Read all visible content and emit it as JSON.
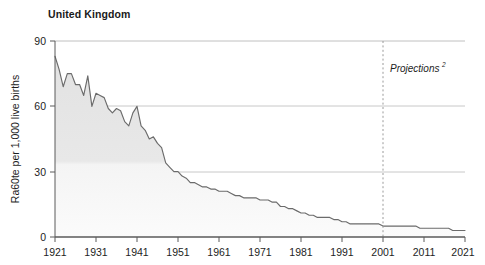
{
  "chart_data": {
    "type": "area",
    "title": "United Kingdom",
    "xlabel": "",
    "ylabel": "Ra60te per 1,000 live births",
    "xlim": [
      1921,
      2021
    ],
    "ylim": [
      0,
      90
    ],
    "yticks": [
      0,
      30,
      60,
      90
    ],
    "ytick_labels": [
      "0",
      "30",
      "60",
      "90"
    ],
    "xticks": [
      1921,
      1931,
      1941,
      1951,
      1961,
      1971,
      1981,
      1991,
      2001,
      2011,
      2021
    ],
    "xtick_labels": [
      "1921",
      "1931",
      "1941",
      "1951",
      "1961",
      "1971",
      "1981",
      "1991",
      "2001",
      "2011",
      "2021"
    ],
    "grid": "horizontal",
    "legend": "none",
    "line_color": "#6b6b6b",
    "fill_color": "#e4e4e4",
    "annotations": [
      {
        "name": "projections-label",
        "text": "Projections",
        "superscript": "2",
        "x": 2004,
        "y": 73,
        "style": "italic"
      },
      {
        "name": "projections-divider",
        "type": "vertical-dashed-line",
        "x": 2001,
        "color": "#9a9a9a"
      }
    ],
    "x": [
      1921,
      1922,
      1923,
      1924,
      1925,
      1926,
      1927,
      1928,
      1929,
      1930,
      1931,
      1932,
      1933,
      1934,
      1935,
      1936,
      1937,
      1938,
      1939,
      1940,
      1941,
      1942,
      1943,
      1944,
      1945,
      1946,
      1947,
      1948,
      1949,
      1950,
      1951,
      1952,
      1953,
      1954,
      1955,
      1956,
      1957,
      1958,
      1959,
      1960,
      1961,
      1962,
      1963,
      1964,
      1965,
      1966,
      1967,
      1968,
      1969,
      1970,
      1971,
      1972,
      1973,
      1974,
      1975,
      1976,
      1977,
      1978,
      1979,
      1980,
      1981,
      1982,
      1983,
      1984,
      1985,
      1986,
      1987,
      1988,
      1989,
      1990,
      1991,
      1992,
      1993,
      1994,
      1995,
      1996,
      1997,
      1998,
      1999,
      2000,
      2001,
      2002,
      2003,
      2004,
      2005,
      2006,
      2007,
      2008,
      2009,
      2010,
      2011,
      2012,
      2013,
      2014,
      2015,
      2016,
      2017,
      2018,
      2019,
      2020,
      2021
    ],
    "values": [
      83,
      77,
      69,
      75,
      75,
      70,
      70,
      65,
      74,
      60,
      66,
      65,
      64,
      59,
      57,
      59,
      58,
      53,
      51,
      57,
      60,
      51,
      49,
      45,
      46,
      43,
      41,
      34,
      32,
      30,
      30,
      28,
      27,
      25,
      25,
      24,
      23,
      23,
      22,
      22,
      21,
      21,
      21,
      20,
      19,
      19,
      18,
      18,
      18,
      18,
      17,
      17,
      17,
      16,
      16,
      14,
      14,
      13,
      13,
      12,
      11,
      11,
      10,
      10,
      9,
      9,
      9,
      9,
      8,
      8,
      7,
      7,
      6,
      6,
      6,
      6,
      6,
      6,
      6,
      6,
      5,
      5,
      5,
      5,
      5,
      5,
      5,
      5,
      5,
      4,
      4,
      4,
      4,
      4,
      4,
      4,
      4,
      3,
      3,
      3,
      3
    ],
    "series_name": "Infant mortality rate"
  },
  "colors": {
    "line": "#6b6b6b",
    "fill": "#e4e4e4",
    "grid": "#c8c8c8",
    "axis": "#555555",
    "text": "#1d1d1d",
    "dashed": "#9a9a9a"
  }
}
